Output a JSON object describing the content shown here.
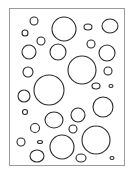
{
  "figure": {
    "background": "#ffffff",
    "stroke": "#2a2a2a",
    "frame": {
      "x": 9,
      "y": 8,
      "width": 115,
      "height": 157,
      "stroke": "#9a9a9a"
    },
    "circles": [
      {
        "cx": 34,
        "cy": 21,
        "rx": 4,
        "ry": 4
      },
      {
        "cx": 25,
        "cy": 33,
        "rx": 3,
        "ry": 3
      },
      {
        "cx": 64,
        "cy": 29,
        "rx": 12,
        "ry": 12
      },
      {
        "cx": 88,
        "cy": 27,
        "rx": 4,
        "ry": 3
      },
      {
        "cx": 110,
        "cy": 26,
        "rx": 8,
        "ry": 7
      },
      {
        "cx": 41,
        "cy": 41,
        "rx": 4,
        "ry": 4
      },
      {
        "cx": 29,
        "cy": 52,
        "rx": 7,
        "ry": 7
      },
      {
        "cx": 58,
        "cy": 52,
        "rx": 8,
        "ry": 8
      },
      {
        "cx": 91,
        "cy": 44,
        "rx": 4,
        "ry": 4
      },
      {
        "cx": 107,
        "cy": 53,
        "rx": 8,
        "ry": 8
      },
      {
        "cx": 82,
        "cy": 70,
        "rx": 14,
        "ry": 14
      },
      {
        "cx": 28,
        "cy": 72,
        "rx": 5,
        "ry": 5
      },
      {
        "cx": 108,
        "cy": 71,
        "rx": 4,
        "ry": 4
      },
      {
        "cx": 49,
        "cy": 90,
        "rx": 15,
        "ry": 15
      },
      {
        "cx": 96,
        "cy": 86,
        "rx": 4,
        "ry": 3
      },
      {
        "cx": 111,
        "cy": 86,
        "rx": 2,
        "ry": 1.5
      },
      {
        "cx": 24,
        "cy": 96,
        "rx": 6,
        "ry": 6
      },
      {
        "cx": 25,
        "cy": 112,
        "rx": 2.5,
        "ry": 2.5
      },
      {
        "cx": 54,
        "cy": 120,
        "rx": 9,
        "ry": 8
      },
      {
        "cx": 78,
        "cy": 115,
        "rx": 7,
        "ry": 7
      },
      {
        "cx": 103,
        "cy": 107,
        "rx": 10,
        "ry": 10
      },
      {
        "cx": 35,
        "cy": 128,
        "rx": 4.5,
        "ry": 4.5
      },
      {
        "cx": 73,
        "cy": 129,
        "rx": 4,
        "ry": 4
      },
      {
        "cx": 21,
        "cy": 142,
        "rx": 4,
        "ry": 4
      },
      {
        "cx": 40,
        "cy": 142,
        "rx": 2.5,
        "ry": 1.5
      },
      {
        "cx": 62,
        "cy": 147,
        "rx": 12,
        "ry": 12
      },
      {
        "cx": 96,
        "cy": 140,
        "rx": 14,
        "ry": 14
      },
      {
        "cx": 37,
        "cy": 156,
        "rx": 7,
        "ry": 6
      },
      {
        "cx": 81,
        "cy": 158,
        "rx": 5,
        "ry": 4
      },
      {
        "cx": 112,
        "cy": 158,
        "rx": 2,
        "ry": 1.5
      }
    ]
  }
}
